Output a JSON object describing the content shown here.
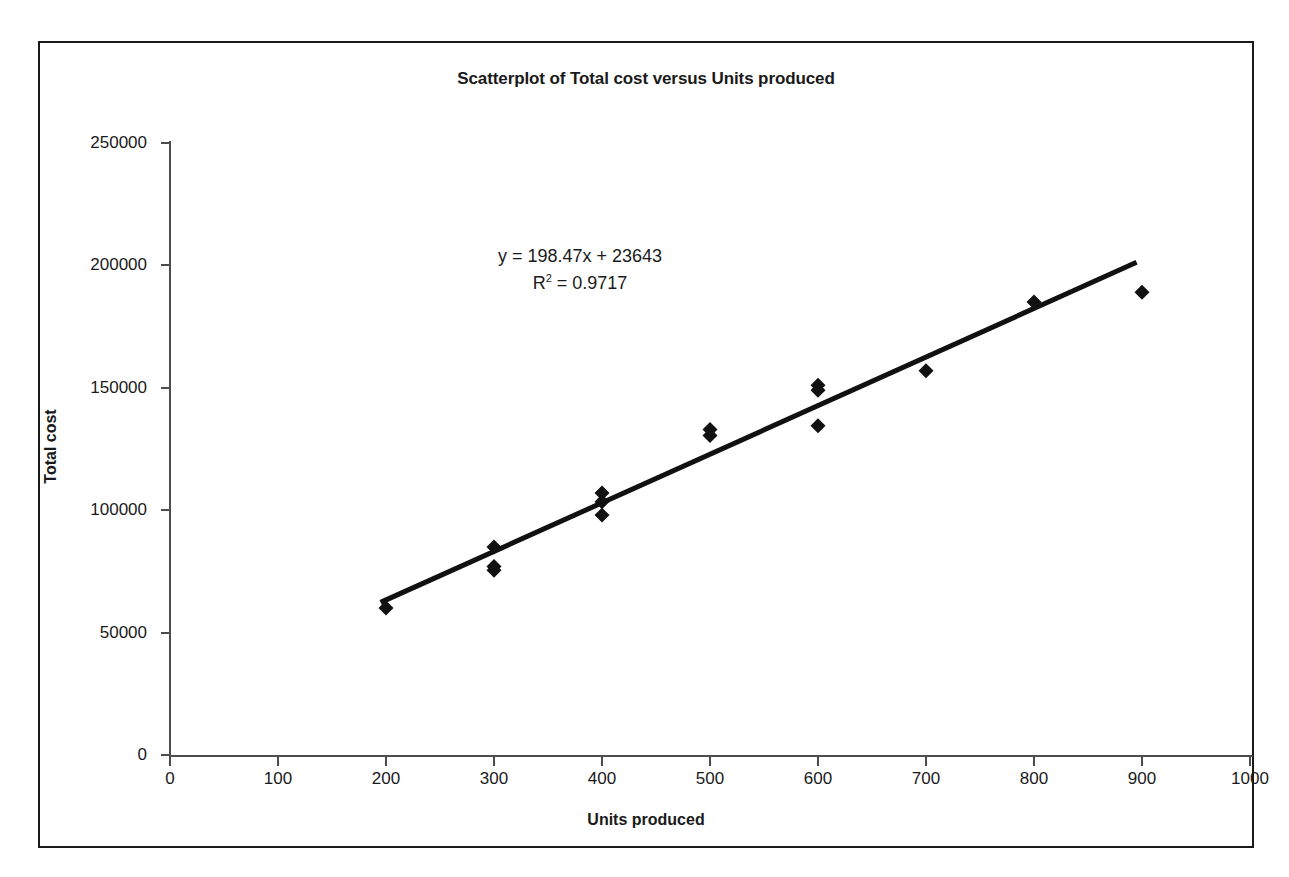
{
  "chart_data": {
    "type": "scatter",
    "title": "Scatterplot of Total cost versus Units produced",
    "xlabel": "Units produced",
    "ylabel": "Total cost",
    "xlim": [
      0,
      1000
    ],
    "ylim": [
      0,
      250000
    ],
    "xticks": [
      0,
      100,
      200,
      300,
      400,
      500,
      600,
      700,
      800,
      900,
      1000
    ],
    "yticks": [
      0,
      50000,
      100000,
      150000,
      200000,
      250000
    ],
    "xtick_labels": [
      "0",
      "100",
      "200",
      "300",
      "400",
      "500",
      "600",
      "700",
      "800",
      "900",
      "1000"
    ],
    "ytick_labels": [
      "0",
      "50000",
      "100000",
      "150000",
      "200000",
      "250000"
    ],
    "grid": false,
    "legend": false,
    "marker": "diamond",
    "marker_color": "#111111",
    "series": [
      {
        "name": "Total cost",
        "points": [
          {
            "x": 200,
            "y": 60000
          },
          {
            "x": 300,
            "y": 85000
          },
          {
            "x": 300,
            "y": 77000
          },
          {
            "x": 300,
            "y": 75500
          },
          {
            "x": 400,
            "y": 107000
          },
          {
            "x": 400,
            "y": 103500
          },
          {
            "x": 400,
            "y": 98000
          },
          {
            "x": 500,
            "y": 133000
          },
          {
            "x": 500,
            "y": 130500
          },
          {
            "x": 600,
            "y": 151000
          },
          {
            "x": 600,
            "y": 149000
          },
          {
            "x": 600,
            "y": 134500
          },
          {
            "x": 700,
            "y": 157000
          },
          {
            "x": 800,
            "y": 185000
          },
          {
            "x": 900,
            "y": 189000
          }
        ]
      }
    ],
    "trendline": {
      "type": "linear",
      "slope": 198.47,
      "intercept": 23643,
      "x_start": 195,
      "x_end": 895,
      "color": "#111111",
      "width": 5
    },
    "annotations": {
      "equation": "y = 198.47x + 23643",
      "r_squared_prefix": "R",
      "r_squared_exponent": "2",
      "r_squared_value": " = 0.9717"
    }
  },
  "style": {
    "background": "#ffffff",
    "axis_color": "#4d4d4d",
    "text_color": "#1a1a1a",
    "border_color": "#1a1a1a"
  }
}
